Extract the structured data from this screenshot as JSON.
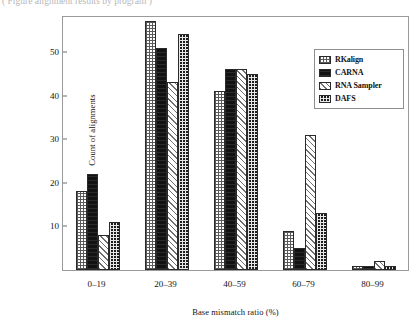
{
  "caption": {
    "text": "( Figure  alignment  results  by  program )"
  },
  "legend": {
    "position": "top-right",
    "entries": [
      {
        "label": "RKalign",
        "pattern": "light-checker"
      },
      {
        "label": "CARNA",
        "pattern": "solid-black"
      },
      {
        "label": "RNA Sampler",
        "pattern": "light-diagonal-hatch"
      },
      {
        "label": "DAFS",
        "pattern": "dark-checker"
      }
    ]
  },
  "chart_data": {
    "type": "bar",
    "title": "",
    "xlabel": "Base  mismatch ratio (%)",
    "ylabel": "Count of alignments",
    "categories": [
      "0–19",
      "20–39",
      "40–59",
      "60–79",
      "80–99"
    ],
    "yticks": [
      10,
      20,
      30,
      40,
      50
    ],
    "ylim": [
      0,
      58
    ],
    "grid": false,
    "legend_position": "upper right",
    "series": [
      {
        "name": "RKalign",
        "values": [
          18,
          57,
          41,
          9,
          1
        ]
      },
      {
        "name": "CARNA",
        "values": [
          22,
          51,
          46,
          5,
          1
        ]
      },
      {
        "name": "RNA Sampler",
        "values": [
          8,
          43,
          46,
          31,
          2
        ]
      },
      {
        "name": "DAFS",
        "values": [
          11,
          54,
          45,
          13,
          1
        ]
      }
    ]
  }
}
